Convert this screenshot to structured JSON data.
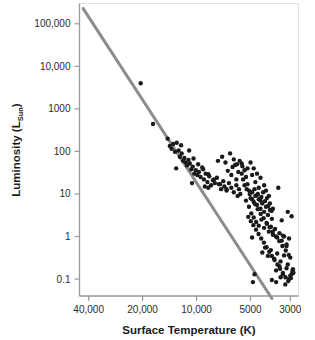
{
  "chart_data": {
    "type": "scatter",
    "title": "",
    "subtitle": "",
    "xlabel": "Surface Temperature (K)",
    "ylabel": "Luminosity (L_Sun)",
    "ylabel_main": "Luminosity (L",
    "ylabel_sub": "Sun",
    "ylabel_tail": ")",
    "xscale": "log-reversed",
    "yscale": "log",
    "xlim": [
      45000,
      2700
    ],
    "ylim": [
      0.04,
      300000
    ],
    "grid": false,
    "legend": null,
    "xticks": [
      {
        "value": 40000,
        "label": "40,000"
      },
      {
        "value": 20000,
        "label": "20,000"
      },
      {
        "value": 10000,
        "label": "10,000"
      },
      {
        "value": 5000,
        "label": "5000"
      },
      {
        "value": 3000,
        "label": "3000"
      }
    ],
    "yticks": [
      {
        "value": 100000,
        "label": "100,000"
      },
      {
        "value": 10000,
        "label": "10,000"
      },
      {
        "value": 1000,
        "label": "1000"
      },
      {
        "value": 100,
        "label": "100"
      },
      {
        "value": 10,
        "label": "10"
      },
      {
        "value": 1,
        "label": "1"
      },
      {
        "value": 0.1,
        "label": "0.1"
      }
    ],
    "annotations": [],
    "series": [
      {
        "name": "main-sequence-fit-line",
        "type": "line",
        "color": "#8c8c8c",
        "width": 3,
        "points": [
          [
            43000,
            230000
          ],
          [
            3800,
            0.035
          ]
        ]
      },
      {
        "name": "stars",
        "type": "scatter",
        "color": "#1a1a1a",
        "marker": "circle",
        "size": 3.4,
        "points": [
          [
            20500,
            4000
          ],
          [
            17500,
            440
          ],
          [
            14500,
            200
          ],
          [
            14100,
            135
          ],
          [
            13800,
            115
          ],
          [
            13500,
            150
          ],
          [
            13200,
            98
          ],
          [
            12900,
            160
          ],
          [
            12600,
            105
          ],
          [
            13000,
            40
          ],
          [
            12400,
            75
          ],
          [
            12100,
            90
          ],
          [
            11900,
            60
          ],
          [
            11700,
            70
          ],
          [
            11500,
            55
          ],
          [
            11300,
            47
          ],
          [
            11100,
            63
          ],
          [
            10900,
            52
          ],
          [
            10700,
            38
          ],
          [
            10500,
            44
          ],
          [
            10300,
            30
          ],
          [
            10100,
            36
          ],
          [
            9900,
            28
          ],
          [
            10600,
            18
          ],
          [
            9700,
            33
          ],
          [
            9500,
            25
          ],
          [
            9300,
            42
          ],
          [
            9100,
            22
          ],
          [
            8900,
            30
          ],
          [
            8700,
            19
          ],
          [
            8500,
            26
          ],
          [
            8300,
            16
          ],
          [
            8100,
            21
          ],
          [
            9000,
            15
          ],
          [
            8600,
            14
          ],
          [
            7900,
            18
          ],
          [
            7700,
            24
          ],
          [
            7500,
            17
          ],
          [
            7300,
            13
          ],
          [
            7100,
            20
          ],
          [
            7600,
            60
          ],
          [
            7200,
            75
          ],
          [
            6900,
            55
          ],
          [
            6700,
            35
          ],
          [
            6500,
            90
          ],
          [
            6300,
            43
          ],
          [
            7000,
            15
          ],
          [
            6800,
            12
          ],
          [
            6600,
            18
          ],
          [
            6400,
            14
          ],
          [
            6200,
            11
          ],
          [
            6000,
            16
          ],
          [
            5900,
            9
          ],
          [
            5800,
            13
          ],
          [
            5700,
            10
          ],
          [
            6100,
            48
          ],
          [
            5600,
            30
          ],
          [
            5500,
            22
          ],
          [
            5400,
            36
          ],
          [
            5300,
            25
          ],
          [
            5200,
            17
          ],
          [
            5100,
            12
          ],
          [
            5000,
            8
          ],
          [
            4900,
            11
          ],
          [
            4800,
            6.5
          ],
          [
            4700,
            9
          ],
          [
            4600,
            5.5
          ],
          [
            4500,
            7.5
          ],
          [
            5600,
            52
          ],
          [
            5200,
            40
          ],
          [
            4900,
            28
          ],
          [
            4700,
            19
          ],
          [
            4500,
            14
          ],
          [
            4400,
            4.5
          ],
          [
            4300,
            6
          ],
          [
            4200,
            3.8
          ],
          [
            4100,
            5
          ],
          [
            4000,
            3.2
          ],
          [
            3900,
            4.2
          ],
          [
            3800,
            2.6
          ],
          [
            4600,
            9.5
          ],
          [
            4400,
            7
          ],
          [
            4250,
            11
          ],
          [
            4050,
            8
          ],
          [
            3900,
            6
          ],
          [
            3750,
            4.5
          ],
          [
            5300,
            7
          ],
          [
            5100,
            5
          ],
          [
            4950,
            3.5
          ],
          [
            4800,
            2.8
          ],
          [
            4650,
            2.2
          ],
          [
            4500,
            1.8
          ],
          [
            4350,
            2.5
          ],
          [
            4200,
            1.6
          ],
          [
            4050,
            2
          ],
          [
            3950,
            1.3
          ],
          [
            3850,
            1.7
          ],
          [
            3750,
            1.1
          ],
          [
            3650,
            1.5
          ],
          [
            3550,
            0.95
          ],
          [
            3450,
            1.2
          ],
          [
            3350,
            0.8
          ],
          [
            3250,
            1.0
          ],
          [
            3150,
            0.65
          ],
          [
            3050,
            0.9
          ],
          [
            4300,
            0.42
          ],
          [
            4150,
            0.55
          ],
          [
            4000,
            0.35
          ],
          [
            3850,
            0.48
          ],
          [
            3700,
            0.3
          ],
          [
            3550,
            0.4
          ],
          [
            3400,
            0.26
          ],
          [
            3250,
            0.36
          ],
          [
            3100,
            0.22
          ],
          [
            3000,
            0.32
          ],
          [
            3600,
            0.16
          ],
          [
            3450,
            0.2
          ],
          [
            3300,
            0.13
          ],
          [
            3150,
            0.18
          ],
          [
            3000,
            0.12
          ],
          [
            2900,
            0.17
          ],
          [
            3800,
            0.095
          ],
          [
            3600,
            0.085
          ],
          [
            3400,
            0.11
          ],
          [
            3200,
            0.075
          ],
          [
            3050,
            0.1
          ],
          [
            2950,
            0.13
          ],
          [
            2880,
            0.14
          ],
          [
            4900,
            0.95
          ],
          [
            4750,
            0.13
          ],
          [
            4850,
            0.085
          ],
          [
            3100,
            3.8
          ],
          [
            2950,
            3.0
          ],
          [
            3350,
            2.4
          ],
          [
            3500,
            14
          ],
          [
            3300,
            1.05
          ],
          [
            3150,
            0.6
          ],
          [
            6400,
            28
          ],
          [
            6000,
            22
          ],
          [
            5750,
            60
          ],
          [
            5550,
            45
          ],
          [
            5850,
            33
          ],
          [
            6200,
            65
          ],
          [
            5950,
            50
          ],
          [
            5000,
            55
          ],
          [
            4800,
            40
          ],
          [
            4600,
            30
          ],
          [
            4400,
            24
          ],
          [
            4200,
            16
          ],
          [
            4100,
            12
          ],
          [
            3950,
            9
          ],
          [
            4750,
            13
          ],
          [
            4550,
            10
          ],
          [
            4350,
            8.5
          ],
          [
            4150,
            6.8
          ],
          [
            3980,
            5.2
          ],
          [
            3820,
            4.0
          ],
          [
            5400,
            16
          ],
          [
            5250,
            13
          ],
          [
            5050,
            10
          ],
          [
            4900,
            7.5
          ],
          [
            4720,
            5.8
          ],
          [
            4560,
            4.4
          ],
          [
            4390,
            3.4
          ],
          [
            4230,
            2.7
          ],
          [
            4070,
            2.1
          ],
          [
            3910,
            1.65
          ],
          [
            3760,
            1.3
          ],
          [
            3610,
            1.0
          ],
          [
            3460,
            0.78
          ],
          [
            3320,
            0.6
          ],
          [
            3180,
            0.47
          ],
          [
            3060,
            0.37
          ],
          [
            5150,
            2.9
          ],
          [
            4980,
            2.3
          ],
          [
            4820,
            1.85
          ],
          [
            4660,
            1.45
          ],
          [
            4510,
            1.15
          ],
          [
            4360,
            0.9
          ],
          [
            4210,
            0.72
          ],
          [
            4070,
            0.56
          ],
          [
            3930,
            0.44
          ],
          [
            3800,
            0.35
          ],
          [
            3670,
            0.28
          ],
          [
            3540,
            0.22
          ],
          [
            3420,
            0.175
          ],
          [
            3300,
            0.14
          ],
          [
            3190,
            0.11
          ],
          [
            3080,
            0.09
          ],
          [
            2980,
            0.105
          ],
          [
            2920,
            0.155
          ],
          [
            11000,
            105
          ],
          [
            10400,
            68
          ],
          [
            9800,
            50
          ],
          [
            9200,
            38
          ],
          [
            8600,
            29
          ],
          [
            8000,
            22
          ],
          [
            7400,
            17
          ],
          [
            6800,
            13
          ],
          [
            12200,
            140
          ]
        ]
      }
    ]
  },
  "axes": {
    "x_axis_name": "surface-temperature-axis",
    "y_axis_name": "luminosity-axis"
  }
}
